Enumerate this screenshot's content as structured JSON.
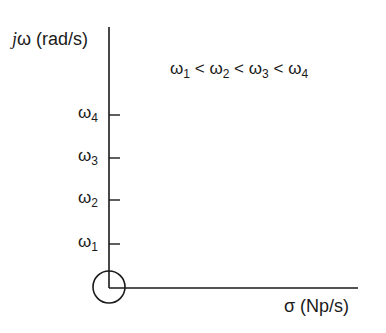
{
  "diagram": {
    "y_axis_label_j": "j",
    "y_axis_label_rest": "ω (rad/s)",
    "x_axis_label": "σ (Np/s)",
    "relation": {
      "parts": [
        {
          "sym": "ω",
          "sub": "1"
        },
        {
          "op": "<"
        },
        {
          "sym": "ω",
          "sub": "2"
        },
        {
          "op": "<"
        },
        {
          "sym": "ω",
          "sub": "3"
        },
        {
          "op": "<"
        },
        {
          "sym": "ω",
          "sub": "4"
        }
      ]
    },
    "ticks": [
      {
        "sym": "ω",
        "sub": "4",
        "y": 115
      },
      {
        "sym": "ω",
        "sub": "3",
        "y": 158
      },
      {
        "sym": "ω",
        "sub": "2",
        "y": 200
      },
      {
        "sym": "ω",
        "sub": "1",
        "y": 244
      }
    ],
    "origin_marker": "circle",
    "colors": {
      "ink": "#1a1a1a",
      "background": "#ffffff"
    }
  }
}
